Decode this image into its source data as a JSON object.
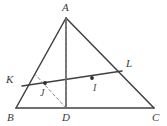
{
  "figure": {
    "width": 167,
    "height": 126,
    "background_color": "#ffffff",
    "stroke_color": "#404040",
    "dashed_color": "#8a8a8a",
    "label_color": "#3a3a3a"
  },
  "labels": {
    "A": "A",
    "B": "B",
    "C": "C",
    "D": "D",
    "K": "K",
    "L": "L",
    "I": "I",
    "J": "J"
  },
  "geometry": {
    "points": {
      "A": {
        "x": 66,
        "y": 18
      },
      "B": {
        "x": 16,
        "y": 108
      },
      "C": {
        "x": 154,
        "y": 108
      },
      "D": {
        "x": 66,
        "y": 108
      },
      "K": {
        "x": 22,
        "y": 86
      },
      "L": {
        "x": 122,
        "y": 71
      },
      "I": {
        "x": 92,
        "y": 78
      },
      "J": {
        "x": 45,
        "y": 83
      }
    },
    "solid_segments": [
      {
        "name": "side-AB",
        "from": "A",
        "to": "B"
      },
      {
        "name": "side-AC",
        "from": "A",
        "to": "C"
      },
      {
        "name": "side-BC",
        "from": "B",
        "to": "C"
      },
      {
        "name": "altitude-AD",
        "from": "A",
        "to": "D"
      },
      {
        "name": "transversal-KL",
        "from": "K",
        "to": "L"
      }
    ],
    "dashed_segments": [
      {
        "name": "segment-AI-D",
        "from": "A",
        "to": "D",
        "via": "I"
      },
      {
        "name": "segment-DJ",
        "from": "D",
        "to": "J",
        "extend_to": {
          "x": 33,
          "y": 72
        }
      }
    ],
    "marked_points": [
      {
        "name": "point-I",
        "x": 92,
        "y": 78
      },
      {
        "name": "point-J",
        "x": 45,
        "y": 83
      }
    ]
  },
  "label_positions": {
    "A": {
      "x": 62,
      "y": 2
    },
    "B": {
      "x": 7,
      "y": 112
    },
    "C": {
      "x": 152,
      "y": 112
    },
    "D": {
      "x": 62,
      "y": 112
    },
    "K": {
      "x": 6,
      "y": 74
    },
    "L": {
      "x": 126,
      "y": 58
    },
    "I": {
      "x": 93,
      "y": 83
    },
    "J": {
      "x": 40,
      "y": 88
    }
  }
}
